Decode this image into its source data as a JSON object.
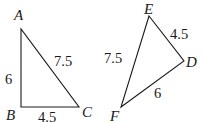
{
  "diagram": {
    "type": "geometry",
    "triangles": [
      {
        "name": "ABC",
        "vertices": [
          {
            "label": "A",
            "x": 21,
            "y": 29,
            "lx": 14,
            "ly": 20
          },
          {
            "label": "B",
            "x": 21,
            "y": 107,
            "lx": 6,
            "ly": 120
          },
          {
            "label": "C",
            "x": 79,
            "y": 107,
            "lx": 82,
            "ly": 117
          }
        ],
        "edges": [
          {
            "from": "A",
            "to": "B",
            "length": "6",
            "lx": 5,
            "ly": 84
          },
          {
            "from": "A",
            "to": "C",
            "length": "7.5",
            "lx": 54,
            "ly": 66
          },
          {
            "from": "B",
            "to": "C",
            "length": "4.5",
            "lx": 38,
            "ly": 122
          }
        ]
      },
      {
        "name": "DEF",
        "vertices": [
          {
            "label": "E",
            "x": 149,
            "y": 16,
            "lx": 144,
            "ly": 14
          },
          {
            "label": "D",
            "x": 184,
            "y": 61,
            "lx": 186,
            "ly": 67
          },
          {
            "label": "F",
            "x": 121,
            "y": 107,
            "lx": 110,
            "ly": 121
          }
        ],
        "edges": [
          {
            "from": "E",
            "to": "D",
            "length": "4.5",
            "lx": 170,
            "ly": 39
          },
          {
            "from": "E",
            "to": "F",
            "length": "7.5",
            "lx": 104,
            "ly": 63
          },
          {
            "from": "D",
            "to": "F",
            "length": "6",
            "lx": 154,
            "ly": 98
          }
        ]
      }
    ]
  },
  "labels": {
    "A": "A",
    "B": "B",
    "C": "C",
    "D": "D",
    "E": "E",
    "F": "F",
    "AB": "6",
    "AC": "7.5",
    "BC": "4.5",
    "ED": "4.5",
    "EF": "7.5",
    "DF": "6"
  }
}
